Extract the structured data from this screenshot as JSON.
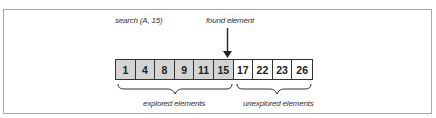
{
  "diagram": {
    "title_label": "search (A, 15)",
    "found_label": "found element",
    "array": [
      {
        "value": "1",
        "state": "explored"
      },
      {
        "value": "4",
        "state": "explored"
      },
      {
        "value": "8",
        "state": "explored"
      },
      {
        "value": "9",
        "state": "explored"
      },
      {
        "value": "11",
        "state": "explored"
      },
      {
        "value": "15",
        "state": "explored"
      },
      {
        "value": "17",
        "state": "unexplored"
      },
      {
        "value": "22",
        "state": "unexplored"
      },
      {
        "value": "23",
        "state": "unexplored"
      },
      {
        "value": "26",
        "state": "unexplored"
      }
    ],
    "explored_label": "explored elements",
    "unexplored_label": "unexplored elements",
    "colors": {
      "explored_fill": "#d4d4d4",
      "unexplored_fill": "#ffffff",
      "stroke": "#333333",
      "frame": "#a8a8a8"
    }
  }
}
